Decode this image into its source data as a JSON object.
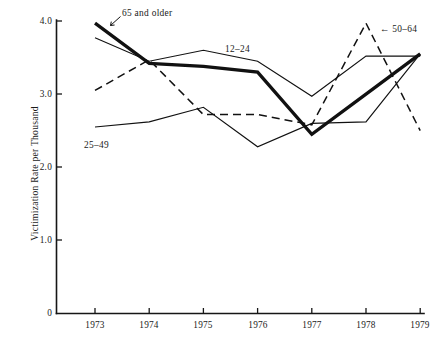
{
  "chart_data": {
    "type": "line",
    "title": "",
    "xlabel": "",
    "ylabel": "Victimization Rate per Thousand",
    "x": [
      "1973",
      "1974",
      "1975",
      "1976",
      "1977",
      "1978",
      "1979"
    ],
    "xlim": [
      1972.6,
      1979.4
    ],
    "ylim": [
      0,
      4.0
    ],
    "yticks": [
      "0",
      "1.0",
      "2.0",
      "3.0",
      "4.0"
    ],
    "ytick_values": [
      0,
      1.0,
      2.0,
      3.0,
      4.0
    ],
    "grid": false,
    "legend_position": "inline-annotations",
    "series": [
      {
        "name": "65 and older",
        "style": "solid-thick",
        "values": [
          3.97,
          3.42,
          3.38,
          3.3,
          2.45,
          3.0,
          3.55
        ]
      },
      {
        "name": "12-24",
        "style": "solid-thin",
        "values": [
          3.77,
          3.45,
          3.6,
          3.45,
          2.97,
          3.52,
          3.52
        ]
      },
      {
        "name": "25-49",
        "style": "solid-thin",
        "values": [
          2.55,
          2.62,
          2.82,
          2.28,
          2.6,
          2.62,
          3.55
        ]
      },
      {
        "name": "50-64",
        "style": "dashed",
        "values": [
          3.05,
          3.47,
          2.72,
          2.72,
          2.58,
          3.97,
          2.5
        ]
      }
    ],
    "annotations": [
      {
        "text": "65 and older",
        "series": "65 and older",
        "marker": "arrow-down-left"
      },
      {
        "text": "12–24",
        "series": "12-24",
        "marker": "none"
      },
      {
        "text": "25–49",
        "series": "25-49",
        "marker": "none"
      },
      {
        "text": "← 50–64",
        "series": "50-64",
        "marker": "arrow-left"
      }
    ]
  },
  "axis": {
    "y_title": "Victimization Rate per Thousand",
    "y_ticks": [
      "4.0",
      "3.0",
      "2.0",
      "1.0",
      "0"
    ],
    "x_ticks": [
      "1973",
      "1974",
      "1975",
      "1976",
      "1977",
      "1978",
      "1979"
    ]
  },
  "annotations": {
    "older65": "65 and older",
    "age12_24": "12–24",
    "age25_49": "25–49",
    "age50_64": "← 50–64"
  },
  "caption": ""
}
